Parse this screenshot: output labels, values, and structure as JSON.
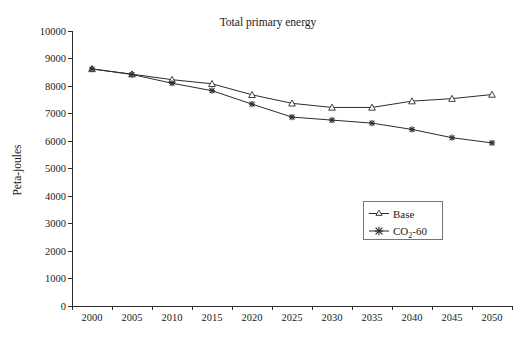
{
  "chart_data": {
    "type": "line",
    "title": "Total primary energy",
    "xlabel": "",
    "ylabel": "Peta-joules",
    "categories": [
      "2000",
      "2005",
      "2010",
      "2015",
      "2020",
      "2025",
      "2030",
      "2035",
      "2040",
      "2045",
      "2050"
    ],
    "ylim": [
      0,
      10000
    ],
    "ytick_step": 1000,
    "yticks": [
      "10000",
      "9000",
      "8000",
      "7000",
      "6000",
      "5000",
      "4000",
      "3000",
      "2000",
      "1000",
      "0"
    ],
    "grid": false,
    "legend_position": "inside-right-lower",
    "series": [
      {
        "name": "Base",
        "marker": "triangle",
        "values": [
          8620,
          8430,
          8230,
          8080,
          7680,
          7370,
          7220,
          7220,
          7450,
          7540,
          7690
        ]
      },
      {
        "name": "CO2-60",
        "name_display": "CO",
        "name_sub": "2",
        "name_suffix": "-60",
        "marker": "x",
        "values": [
          8620,
          8420,
          8100,
          7830,
          7340,
          6870,
          6760,
          6650,
          6420,
          6120,
          5930
        ]
      }
    ]
  },
  "legend": {
    "items": [
      {
        "label": "Base"
      },
      {
        "label_main": "CO",
        "label_sub": "2",
        "label_tail": "-60"
      }
    ]
  },
  "axis": {
    "y_label": "Peta-joules"
  },
  "colors": {
    "line": "#2b2b2b",
    "text": "#1a1a1a",
    "legend_border": "#767676",
    "background": "#ffffff"
  }
}
